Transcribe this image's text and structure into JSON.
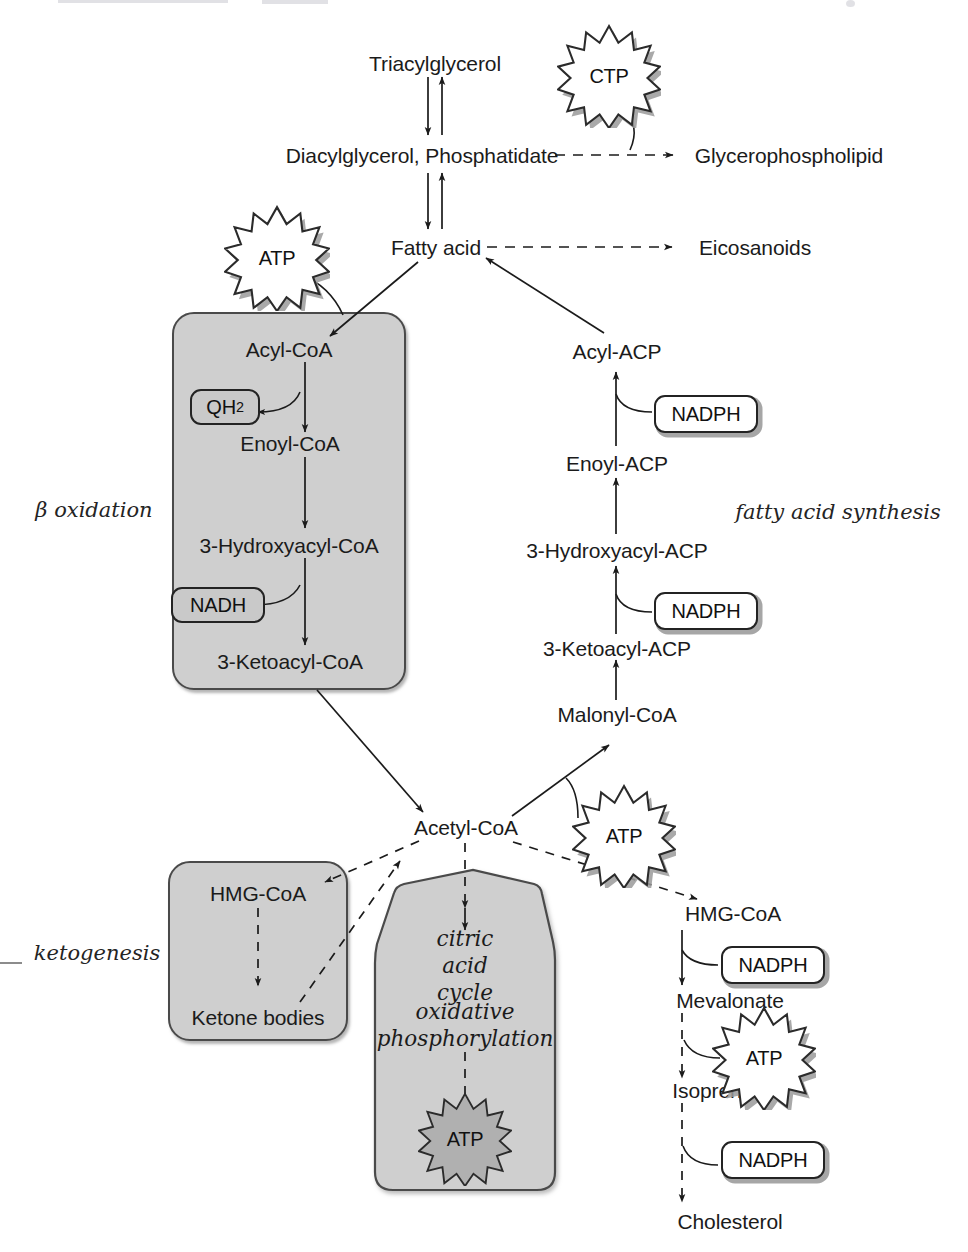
{
  "diagram": {
    "type": "pathway-map",
    "colors": {
      "compartment_fill": "#cfcfcf",
      "compartment_stroke": "#4a4a4a",
      "badge_gray_fill": "#c9c9c9",
      "badge_white_fill": "#ffffff",
      "burst_fill": "#ffffff",
      "burst_shadow": "#9a9a9a",
      "text": "#1b1b1b",
      "arrow": "#1b1b1b"
    }
  },
  "captions": {
    "beta_oxidation": "β oxidation",
    "fatty_acid_synthesis": "fatty acid synthesis",
    "ketogenesis": "ketogenesis",
    "citric_acid_cycle_line1": "citric",
    "citric_acid_cycle_line2": "acid",
    "citric_acid_cycle_line3": "cycle",
    "oxphos_line1": "oxidative",
    "oxphos_line2": "phosphorylation"
  },
  "metabolites": {
    "triacylglycerol": "Triacylglycerol",
    "diacylglycerol_phosphatidate": "Diacylglycerol, Phosphatidate",
    "glycerophospholipid": "Glycerophospholipid",
    "fatty_acid": "Fatty acid",
    "eicosanoids": "Eicosanoids",
    "acyl_coa": "Acyl-CoA",
    "enoyl_coa": "Enoyl-CoA",
    "hydroxyacyl_coa": "3-Hydroxyacyl-CoA",
    "ketoacyl_coa": "3-Ketoacyl-CoA",
    "acyl_acp": "Acyl-ACP",
    "enoyl_acp": "Enoyl-ACP",
    "hydroxyacyl_acp": "3-Hydroxyacyl-ACP",
    "ketoacyl_acp": "3-Ketoacyl-ACP",
    "malonyl_coa": "Malonyl-CoA",
    "acetyl_coa": "Acetyl-CoA",
    "hmg_coa_keto": "HMG-CoA",
    "ketone_bodies": "Ketone bodies",
    "hmg_coa_chol": "HMG-CoA",
    "mevalonate": "Mevalonate",
    "isoprenoids": "Isoprenoids",
    "cholesterol": "Cholesterol"
  },
  "cofactors": {
    "qh2_text": "QH",
    "qh2_sub": "2",
    "nadh": "NADH",
    "nadph_acyl_acp": "NADPH",
    "nadph_hydroxyacyl_acp": "NADPH",
    "nadph_mevalonate": "NADPH",
    "nadph_cholesterol": "NADPH"
  },
  "energy": {
    "ctp": "CTP",
    "atp_activation": "ATP",
    "atp_malonyl": "ATP",
    "atp_mitochondrion": "ATP",
    "atp_isoprenoid": "ATP"
  },
  "compartment_labels": {
    "beta_oxidation_box": "beta-oxidation compartment",
    "ketogenesis_box": "ketogenesis compartment",
    "mitochondrion_box": "mitochondrion compartment"
  }
}
